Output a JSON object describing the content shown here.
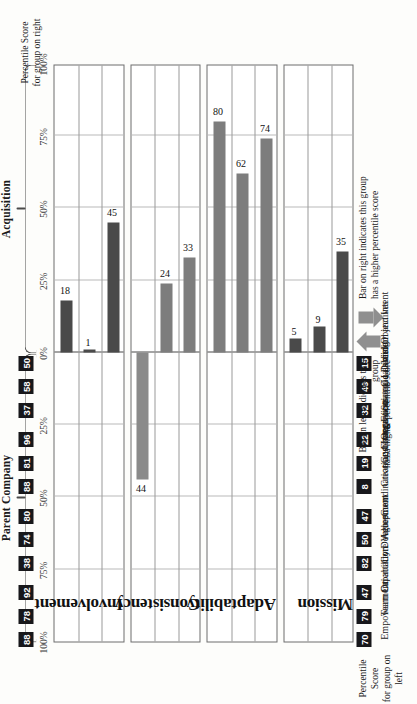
{
  "chart_data": {
    "type": "bar",
    "title": "",
    "xlabel": "",
    "ylabel": "",
    "orientation": "diverging-vertical",
    "axis_ticks": [
      "100%",
      "75%",
      "50%",
      "25%",
      "0%",
      "25%",
      "50%",
      "75%",
      "100%"
    ],
    "axis_tick_values": [
      -100,
      -75,
      -50,
      -25,
      0,
      25,
      50,
      75,
      100
    ],
    "xlim": [
      -100,
      100
    ],
    "grid": true,
    "groups": [
      {
        "name": "Parent Company",
        "side": "left",
        "note": "Bar on left indicates this group has a higher percentile score"
      },
      {
        "name": "Acquisition",
        "side": "right",
        "note": "Bar on right indicates this group has a higher percentile score"
      }
    ],
    "panels": [
      {
        "name": "Involvement",
        "items": [
          {
            "label": "Empowerment",
            "difference": 18,
            "side": "right",
            "shade": "dark",
            "percentile_left": 70,
            "percentile_right": 88
          },
          {
            "label": "Team Orientation",
            "difference": 1,
            "side": "right",
            "shade": "dark",
            "percentile_left": 79,
            "percentile_right": 78
          },
          {
            "label": "Capability Development",
            "difference": 45,
            "side": "right",
            "shade": "dark",
            "percentile_left": 47,
            "percentile_right": 92
          }
        ]
      },
      {
        "name": "Consistency",
        "items": [
          {
            "label": "Core Values",
            "difference": 44,
            "side": "left",
            "shade": "medium",
            "percentile_left": 82,
            "percentile_right": 38
          },
          {
            "label": "Agreement",
            "difference": 24,
            "side": "right",
            "shade": "medium",
            "percentile_left": 50,
            "percentile_right": 74
          },
          {
            "label": "Coordination and Integration",
            "difference": 33,
            "side": "right",
            "shade": "medium",
            "percentile_left": 47,
            "percentile_right": 80
          }
        ]
      },
      {
        "name": "Adaptability",
        "items": [
          {
            "label": "Creating Change",
            "difference": 80,
            "side": "right",
            "shade": "medium",
            "percentile_left": 8,
            "percentile_right": 88
          },
          {
            "label": "Customer Focus",
            "difference": 62,
            "side": "right",
            "shade": "medium",
            "percentile_left": 19,
            "percentile_right": 81
          },
          {
            "label": "Organizational Learning",
            "difference": 74,
            "side": "right",
            "shade": "medium",
            "percentile_left": 22,
            "percentile_right": 96
          }
        ]
      },
      {
        "name": "Mission",
        "items": [
          {
            "label": "Strategic Direction and Intent",
            "difference": 5,
            "side": "right",
            "shade": "dark",
            "percentile_left": 32,
            "percentile_right": 37
          },
          {
            "label": "Goals and Objectives",
            "difference": 9,
            "side": "right",
            "shade": "dark",
            "percentile_left": 49,
            "percentile_right": 58
          },
          {
            "label": "Vision",
            "difference": 35,
            "side": "right",
            "shade": "dark",
            "percentile_left": 15,
            "percentile_right": 50
          }
        ]
      }
    ],
    "legend": {
      "left_caption": "Percentile Score\nfor group on left",
      "right_caption": "Percentile Score\nfor group on right",
      "arrow_up_caption": "Bar on right indicates this group\nhas a higher percentile score",
      "arrow_down_caption": "Bar on left indicates this group\nhas a higher percentile score"
    },
    "colors": {
      "bar_dark": "#4a4a4a",
      "bar_medium": "#7d7d7d",
      "bar_left": "#8a8a8a",
      "badge_bg": "#17171a",
      "badge_text": "#ffffff",
      "panel_border": "#6d6d6d",
      "grid": "#b9b9b9",
      "background": "#fdfdfb"
    }
  }
}
